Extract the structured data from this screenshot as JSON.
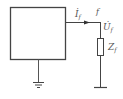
{
  "diagram": {
    "type": "circuit-schematic",
    "network_box": {
      "label": ""
    },
    "current_label": "İ",
    "current_subscript": "f",
    "node_label": "f",
    "voltage_label": "U̇",
    "voltage_subscript": "f",
    "impedance_label": "Z",
    "impedance_subscript": "f",
    "colors": {
      "line": "#444444",
      "text": "#555555",
      "background": "#ffffff"
    }
  }
}
